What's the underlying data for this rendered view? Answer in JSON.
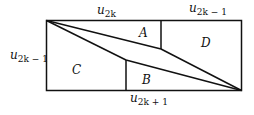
{
  "diagram": {
    "labels": {
      "top_left": {
        "base": "u",
        "sub": "2k"
      },
      "top_right": {
        "base": "u",
        "sub": "2k − 1"
      },
      "left": {
        "base": "u",
        "sub": "2k − 1"
      },
      "bottom": {
        "base": "u",
        "sub": "2k + 1"
      }
    },
    "regions": {
      "a": "A",
      "b": "B",
      "c": "C",
      "d": "D"
    },
    "colors": {
      "stroke": "#111111",
      "background": "#ffffff"
    }
  }
}
